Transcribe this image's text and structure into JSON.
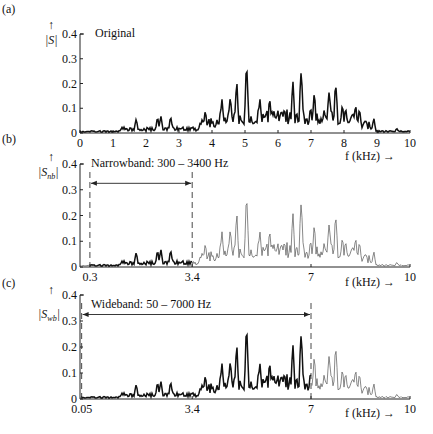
{
  "chart_data": [
    {
      "type": "line",
      "panel_label": "(a)",
      "title": "Original",
      "ylabel": "|S|",
      "xlabel": "f (kHz) →",
      "xlim": [
        0,
        10
      ],
      "ylim": [
        0,
        0.4
      ],
      "xticks": [
        "0",
        "1",
        "2",
        "3",
        "4",
        "5",
        "6",
        "7",
        "8",
        "9",
        "10"
      ],
      "yticks": [
        "0",
        "0.1",
        "0.2",
        "0.3",
        "0.4"
      ],
      "band": null,
      "peaks": [
        {
          "f": 1.7,
          "v": 0.06
        },
        {
          "f": 2.35,
          "v": 0.065
        },
        {
          "f": 2.45,
          "v": 0.07
        },
        {
          "f": 2.75,
          "v": 0.07
        },
        {
          "f": 3.8,
          "v": 0.09
        },
        {
          "f": 4.3,
          "v": 0.14
        },
        {
          "f": 4.55,
          "v": 0.16
        },
        {
          "f": 4.75,
          "v": 0.21
        },
        {
          "f": 5.05,
          "v": 0.3
        },
        {
          "f": 5.45,
          "v": 0.14
        },
        {
          "f": 5.75,
          "v": 0.15
        },
        {
          "f": 6.45,
          "v": 0.21
        },
        {
          "f": 6.7,
          "v": 0.27
        },
        {
          "f": 7.1,
          "v": 0.16
        },
        {
          "f": 7.55,
          "v": 0.19
        },
        {
          "f": 7.75,
          "v": 0.22
        },
        {
          "f": 7.95,
          "v": 0.12
        },
        {
          "f": 8.35,
          "v": 0.12
        },
        {
          "f": 8.9,
          "v": 0.06
        },
        {
          "f": 9.6,
          "v": 0.02
        }
      ]
    },
    {
      "type": "line",
      "panel_label": "(b)",
      "title": "Narrowband: 300 – 3400 Hz",
      "ylabel": "|S_nb|",
      "xlabel": "f (kHz) →",
      "xlim": [
        0,
        10
      ],
      "ylim": [
        0,
        0.4
      ],
      "xticks": [
        "0.3",
        "3.4",
        "7",
        "10"
      ],
      "yticks": [
        "0",
        "0.1",
        "0.2",
        "0.3",
        "0.4"
      ],
      "band": [
        0.3,
        3.4
      ]
    },
    {
      "type": "line",
      "panel_label": "(c)",
      "title": "Wideband: 50 – 7000 Hz",
      "ylabel": "|S_wb|",
      "xlabel": "f (kHz) →",
      "xlim": [
        0,
        10
      ],
      "ylim": [
        0,
        0.4
      ],
      "xticks": [
        "0.05",
        "3.4",
        "7",
        "10"
      ],
      "yticks": [
        "0",
        "0.1",
        "0.2",
        "0.3",
        "0.4"
      ],
      "band": [
        0.05,
        7.0
      ]
    }
  ],
  "panels": {
    "a": {
      "label": "(a)",
      "title": "Original",
      "ylabel": "|S|",
      "xlabel": "f (kHz) →"
    },
    "b": {
      "label": "(b)",
      "title": "Narrowband: 300 – 3400 Hz",
      "ylabel_main": "|S",
      "ylabel_sub": "nb",
      "xlabel": "f (kHz) →"
    },
    "c": {
      "label": "(c)",
      "title": "Wideband: 50 – 7000 Hz",
      "ylabel_main": "|S",
      "ylabel_sub": "wb",
      "xlabel": "f (kHz) →"
    }
  },
  "arrow_glyph": "↑"
}
